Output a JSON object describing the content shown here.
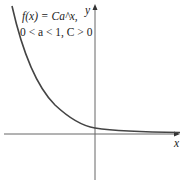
{
  "figure": {
    "equation_line1": "f(x) = Ca^x,",
    "equation_line2": "0 < a < 1, C > 0",
    "x_axis_label": "x",
    "y_axis_label": "y",
    "axis_color": "#555555",
    "curve_color": "#444444"
  }
}
